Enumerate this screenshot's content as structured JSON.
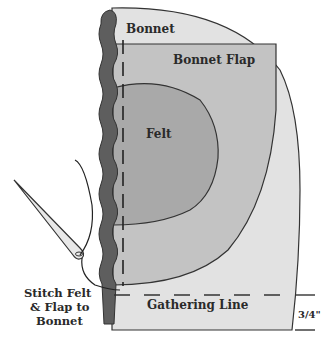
{
  "diagram": {
    "labels": {
      "bonnet": "Bonnet",
      "bonnet_flap": "Bonnet Flap",
      "felt": "Felt",
      "gathering_line": "Gathering Line",
      "measurement": "3/4\"",
      "instruction_line1": "Stitch Felt",
      "instruction_line2": "& Flap to",
      "instruction_line3": "Bonnet"
    },
    "colors": {
      "bonnet_fill": "#e2e2e2",
      "flap_fill": "#c3c3c3",
      "felt_fill": "#a9a9a9",
      "edge_fill": "#5e5e5e",
      "outline": "#333333"
    }
  }
}
